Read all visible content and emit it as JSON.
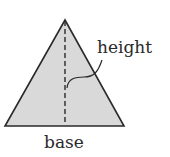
{
  "diagram": {
    "type": "triangle",
    "labels": {
      "height": "height",
      "base": "base"
    },
    "colors": {
      "fill": "#d9d9d9",
      "stroke": "#2a2a2a",
      "dashed_line": "#2a2a2a",
      "text": "#2a2a2a"
    }
  }
}
